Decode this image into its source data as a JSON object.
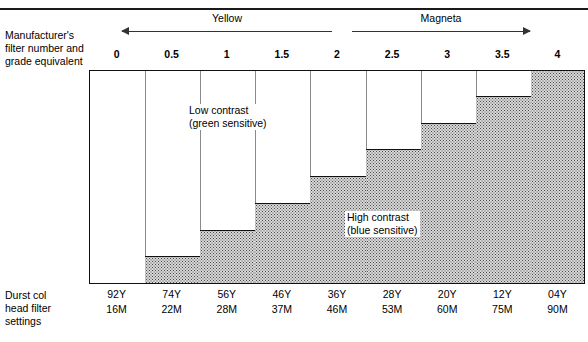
{
  "figure": {
    "left_caption_top": "Manufacturer's\nfilter number and\ngrade equivalent",
    "left_caption_lines": [
      "Manufacturer's",
      "filter number and",
      "grade equivalent"
    ],
    "left_caption_bottom_lines": [
      "Durst col",
      "head filter",
      "settings"
    ],
    "bands": [
      {
        "label": "Yellow",
        "arrow": "left"
      },
      {
        "label": "Magneta",
        "arrow": "right"
      }
    ],
    "annotations": [
      {
        "line1": "Low contrast",
        "line2": "(green sensitive)"
      },
      {
        "line1": "High contrast",
        "line2": "(blue sensitive)"
      }
    ],
    "colors": {
      "rule": "#1a1a1a",
      "outline": "#111111",
      "gridline": "#8a8a8a",
      "fill": "#d8d8d8",
      "stipple": "#4a4a4a",
      "background": "#ffffff"
    }
  },
  "chart_data": {
    "type": "bar",
    "title": "",
    "xlabel": "Manufacturer's filter number and grade equivalent",
    "ylabel": "",
    "grid": true,
    "legend_position": "none",
    "categories": [
      "0",
      "0.5",
      "1",
      "1.5",
      "2",
      "2.5",
      "3",
      "3.5",
      "4"
    ],
    "values": [
      0,
      12.5,
      25,
      37.5,
      50,
      62.5,
      75,
      87.5,
      100
    ],
    "ylim": [
      0,
      100
    ],
    "value_unit": "percent of full column height (relative contrast / magenta proportion)",
    "series": [
      {
        "name": "Shaded step height (magenta / high contrast proportion)",
        "values": [
          0,
          12.5,
          25,
          37.5,
          50,
          62.5,
          75,
          87.5,
          100
        ]
      }
    ],
    "annotations": [
      {
        "text": "Low contrast (green sensitive)",
        "at_category": "1",
        "note": "upper-left unshaded region"
      },
      {
        "text": "High contrast (blue sensitive)",
        "at_category": "2.5",
        "note": "lower-right shaded region"
      }
    ],
    "band_ranges": [
      {
        "label": "Yellow",
        "from": "0",
        "to": "2",
        "arrow": "left"
      },
      {
        "label": "Magneta",
        "from": "2.5",
        "to": "4",
        "arrow": "right"
      }
    ],
    "table": {
      "row_label_lines": [
        "Durst col",
        "head filter",
        "settings"
      ],
      "columns": [
        "0",
        "0.5",
        "1",
        "1.5",
        "2",
        "2.5",
        "3",
        "3.5",
        "4"
      ],
      "rows": [
        {
          "name": "yellow",
          "values": [
            "92Y",
            "74Y",
            "56Y",
            "46Y",
            "36Y",
            "28Y",
            "20Y",
            "12Y",
            "04Y"
          ]
        },
        {
          "name": "magenta",
          "values": [
            "16M",
            "22M",
            "28M",
            "37M",
            "46M",
            "53M",
            "60M",
            "75M",
            "90M"
          ]
        }
      ]
    }
  }
}
